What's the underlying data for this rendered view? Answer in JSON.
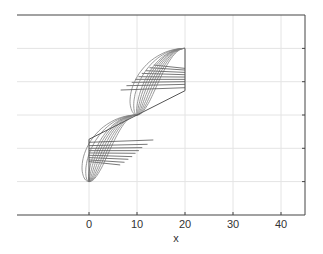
{
  "chart_data": {
    "type": "line",
    "title": "",
    "xlabel": "x",
    "ylabel": "",
    "xlim": [
      -15,
      45
    ],
    "ylim": [
      -3,
      3
    ],
    "grid": true,
    "legend": null,
    "x_ticks": [
      0,
      10,
      20,
      30,
      40
    ],
    "x_tick_labels": [
      "0",
      "10",
      "20",
      "30",
      "40"
    ],
    "y_ticks": [
      -2,
      -1,
      0,
      1,
      2
    ],
    "y_tick_labels": [],
    "center_point": [
      10,
      0
    ],
    "upper_family": {
      "start": [
        10,
        0
      ],
      "end": [
        20,
        2
      ],
      "bulges": [
        0.5,
        1.0,
        1.5,
        2.0,
        2.5,
        3.0,
        3.5,
        4.5,
        5.5
      ],
      "chord_starts": [
        [
          13.5,
          1.5
        ],
        [
          12.6,
          1.42
        ],
        [
          11.8,
          1.33
        ],
        [
          11.0,
          1.25
        ],
        [
          10.3,
          1.15
        ],
        [
          9.6,
          1.07
        ],
        [
          8.9,
          0.98
        ],
        [
          7.8,
          0.88
        ],
        [
          6.6,
          0.75
        ]
      ],
      "chord_ends_y": [
        1.4,
        1.35,
        1.28,
        1.21,
        1.14,
        1.07,
        1.0,
        0.92,
        0.82
      ],
      "vertical_edge": {
        "x": 20,
        "y_from": 2,
        "y_to": 0.73
      }
    },
    "lower_family": {
      "start": [
        10,
        0
      ],
      "end": [
        0,
        -2
      ],
      "bulges": [
        0.5,
        1.0,
        1.5,
        2.0,
        2.5,
        3.0,
        3.5,
        4.5,
        5.5
      ],
      "chord_starts": [
        [
          6.5,
          -1.5
        ],
        [
          7.4,
          -1.42
        ],
        [
          8.2,
          -1.33
        ],
        [
          9.0,
          -1.25
        ],
        [
          9.7,
          -1.15
        ],
        [
          10.4,
          -1.07
        ],
        [
          11.1,
          -0.98
        ],
        [
          12.2,
          -0.88
        ],
        [
          13.4,
          -0.75
        ]
      ],
      "chord_ends_y": [
        -1.4,
        -1.35,
        -1.28,
        -1.21,
        -1.14,
        -1.07,
        -1.0,
        -0.92,
        -0.82
      ],
      "vertical_edge": {
        "x": 0,
        "y_from": -2,
        "y_to": -0.73
      }
    },
    "diagonal_line": {
      "from": [
        0,
        -0.73
      ],
      "to": [
        20,
        0.73
      ]
    },
    "colors": {
      "curves": "#808080",
      "lines": "#555555",
      "grid": "#e4e4e4",
      "axis": "#444444"
    }
  },
  "axes": {
    "xlabel": "x",
    "xticks": [
      "0",
      "10",
      "20",
      "30",
      "40"
    ]
  }
}
